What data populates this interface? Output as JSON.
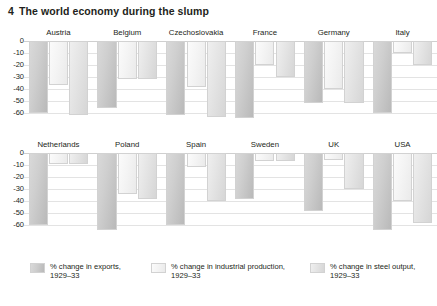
{
  "figure": {
    "number": "4",
    "title": "The world economy during the slump"
  },
  "axis": {
    "ticks": [
      "0",
      "-10",
      "-20",
      "-30",
      "-40",
      "-50",
      "-60"
    ],
    "min": -65,
    "max": 0
  },
  "legend": [
    {
      "label_line1": "% change in exports,",
      "label_line2": "1929–33",
      "series": "exports",
      "color": "#c7c7c7"
    },
    {
      "label_line1": "% change in industrial production,",
      "label_line2": "1929–33",
      "series": "industrial_production",
      "color": "#f3f3f3"
    },
    {
      "label_line1": "% change in steel output,",
      "label_line2": "1929–33",
      "series": "steel_output",
      "color": "#e3e3e3"
    }
  ],
  "chart_data": {
    "type": "bar",
    "title": "The world economy during the slump",
    "xlabel": "",
    "ylabel": "% change, 1929–33",
    "ylim": [
      -65,
      0
    ],
    "grid": true,
    "legend_position": "bottom",
    "categories": [
      "Austria",
      "Belgium",
      "Czechoslovakia",
      "France",
      "Germany",
      "Italy",
      "Netherlands",
      "Poland",
      "Spain",
      "Sweden",
      "UK",
      "USA"
    ],
    "series": [
      {
        "name": "% change in exports, 1929–33",
        "values": [
          -60,
          -56,
          -62,
          -64,
          -52,
          -60,
          -60,
          -64,
          -60,
          -38,
          -48,
          -64
        ]
      },
      {
        "name": "% change in industrial production, 1929–33",
        "values": [
          -37,
          -32,
          -38,
          -20,
          -40,
          -10,
          -9,
          -34,
          -12,
          -7,
          -6,
          -40
        ]
      },
      {
        "name": "% change in steel output, 1929–33",
        "values": [
          -62,
          -32,
          -63,
          -30,
          -52,
          -20,
          -9,
          -38,
          -40,
          -7,
          -30,
          -58
        ]
      }
    ]
  },
  "rows": [
    {
      "panels": [
        "Austria",
        "Belgium",
        "Czechoslovakia",
        "France",
        "Germany",
        "Italy"
      ]
    },
    {
      "panels": [
        "Netherlands",
        "Poland",
        "Spain",
        "Sweden",
        "UK",
        "USA"
      ]
    }
  ]
}
